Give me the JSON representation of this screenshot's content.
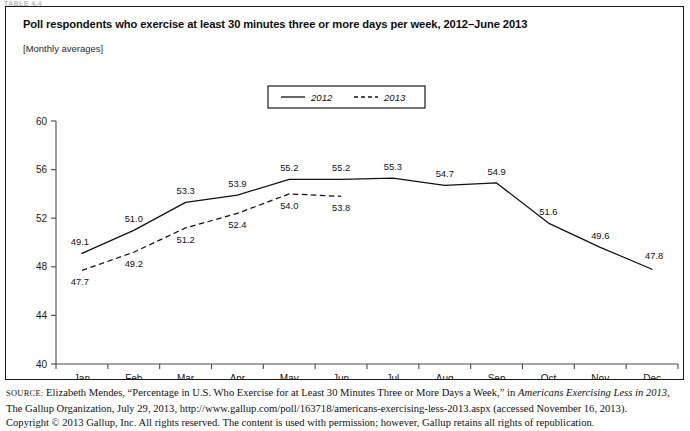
{
  "clipped_header": "TABLE 4.4",
  "figure": {
    "title": "Poll respondents who exercise at least 30 minutes three or more days per week, 2012–June 2013",
    "subtitle": "[Monthly averages]"
  },
  "source_note": {
    "label": "SOURCE:",
    "line1_a": " Elizabeth Mendes, “Percentage in U.S. Who Exercise for at Least 30 Minutes Three or More Days a Week,” in ",
    "line1_italic": "Americans Exercising Less in 2013,",
    "line2": "The Gallup Organization, July 29, 2013, http://www.gallup.com/poll/163718/americans-exercising-less-2013.aspx (accessed November 16, 2013).",
    "line3": "Copyright © 2013 Gallup, Inc. All rights reserved. The content is used with permission; however, Gallup retains all rights of republication."
  },
  "chart_data": {
    "type": "line",
    "title": "Poll respondents who exercise at least 30 minutes three or more days per week, 2012–June 2013",
    "subtitle": "[Monthly averages]",
    "xlabel": "",
    "ylabel": "",
    "ylim": [
      40,
      60
    ],
    "yticks": [
      40,
      44,
      48,
      52,
      56,
      60
    ],
    "grid": false,
    "legend_position": "top-center",
    "categories": [
      "Jan",
      "Feb",
      "Mar",
      "Apr",
      "May",
      "Jun",
      "Jul",
      "Aug",
      "Sep",
      "Oct",
      "Nov",
      "Dec"
    ],
    "series": [
      {
        "name": "2012",
        "style": "solid",
        "color": "#111111",
        "values": [
          49.1,
          51.0,
          53.3,
          53.9,
          55.2,
          55.2,
          55.3,
          54.7,
          54.9,
          51.6,
          49.6,
          47.8
        ],
        "labels": [
          "49.1",
          "51.0",
          "53.3",
          "53.9",
          "55.2",
          "55.2",
          "55.3",
          "54.7",
          "54.9",
          "51.6",
          "49.6",
          "47.8"
        ]
      },
      {
        "name": "2013",
        "style": "dashed",
        "color": "#111111",
        "values": [
          47.7,
          49.2,
          51.2,
          52.4,
          54.0,
          53.8,
          null,
          null,
          null,
          null,
          null,
          null
        ],
        "labels": [
          "47.7",
          "49.2",
          "51.2",
          "52.4",
          "54.0",
          "53.8"
        ]
      }
    ]
  }
}
